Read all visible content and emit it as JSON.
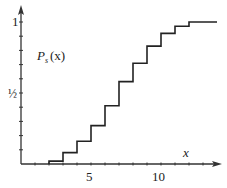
{
  "chart_data": {
    "type": "line",
    "style": "step",
    "title": "",
    "series_label": "P_s(x)",
    "series_label_main": "P",
    "series_label_sub": "s",
    "series_label_arg": "(x)",
    "xlabel": "x",
    "ylabel": "",
    "x_tick_labels": [
      "5",
      "10"
    ],
    "y_tick_labels": [
      "1",
      "½"
    ],
    "xlim": [
      0,
      14
    ],
    "ylim": [
      0,
      1
    ],
    "x_minor_tick_step": 1,
    "y_minor_tick_step": 0.1,
    "grid": false,
    "legend": "none",
    "series": [
      {
        "name": "P_s(x)",
        "x": [
          0,
          2,
          3,
          4,
          5,
          6,
          7,
          8,
          9,
          10,
          11,
          12,
          14
        ],
        "values": [
          0,
          0.02,
          0.08,
          0.16,
          0.27,
          0.41,
          0.58,
          0.71,
          0.83,
          0.92,
          0.97,
          1.0,
          1.0
        ]
      }
    ],
    "colors": {
      "line": "#222222",
      "axis": "#333333",
      "background": "#ffffff"
    }
  }
}
